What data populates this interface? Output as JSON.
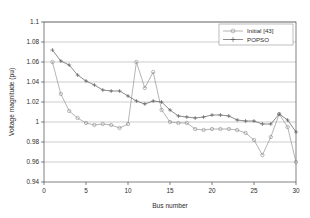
{
  "chart_data": {
    "type": "line",
    "title": "",
    "xlabel": "Bus number",
    "ylabel": "Voltage magnitude (pu)",
    "xlim": [
      0,
      30
    ],
    "ylim": [
      0.94,
      1.1
    ],
    "xticks": [
      0,
      5,
      10,
      15,
      20,
      25,
      30
    ],
    "xticklabels": [
      "0",
      "5",
      "10",
      "15",
      "20",
      "25",
      "30"
    ],
    "yticks": [
      0.94,
      0.96,
      0.98,
      1,
      1.02,
      1.04,
      1.06,
      1.08,
      1.1
    ],
    "yticklabels": [
      "0.94",
      "0.96",
      "0.98",
      "1",
      "1.02",
      "1.04",
      "1.06",
      "1.08",
      "1.1"
    ],
    "grid": "horizontal",
    "legend_position": "upper-right",
    "x": [
      1,
      2,
      3,
      4,
      5,
      6,
      7,
      8,
      9,
      10,
      11,
      12,
      13,
      14,
      15,
      16,
      17,
      18,
      19,
      20,
      21,
      22,
      23,
      24,
      25,
      26,
      27,
      28,
      29,
      30
    ],
    "series": [
      {
        "name": "Initial [43]",
        "marker": "circle-open",
        "color": "#8c8c8c",
        "values": [
          1.06,
          1.028,
          1.011,
          1.004,
          0.999,
          0.997,
          0.998,
          0.997,
          0.994,
          0.998,
          1.06,
          1.034,
          1.05,
          1.012,
          1.0,
          0.999,
          0.999,
          0.993,
          0.992,
          0.993,
          0.993,
          0.993,
          0.992,
          0.989,
          0.982,
          0.967,
          0.985,
          1.008,
          0.995,
          0.96
        ]
      },
      {
        "name": "POPSO",
        "marker": "plus",
        "color": "#4d4d4d",
        "values": [
          1.072,
          1.061,
          1.057,
          1.047,
          1.041,
          1.037,
          1.032,
          1.031,
          1.031,
          1.026,
          1.021,
          1.018,
          1.021,
          1.02,
          1.012,
          1.006,
          1.005,
          1.004,
          1.005,
          1.007,
          1.007,
          1.006,
          1.002,
          1.001,
          1.001,
          0.998,
          0.998,
          1.008,
          1.002,
          0.99
        ]
      }
    ]
  },
  "legend": {
    "items": [
      {
        "label": "Initial [43]"
      },
      {
        "label": "POPSO"
      }
    ]
  }
}
